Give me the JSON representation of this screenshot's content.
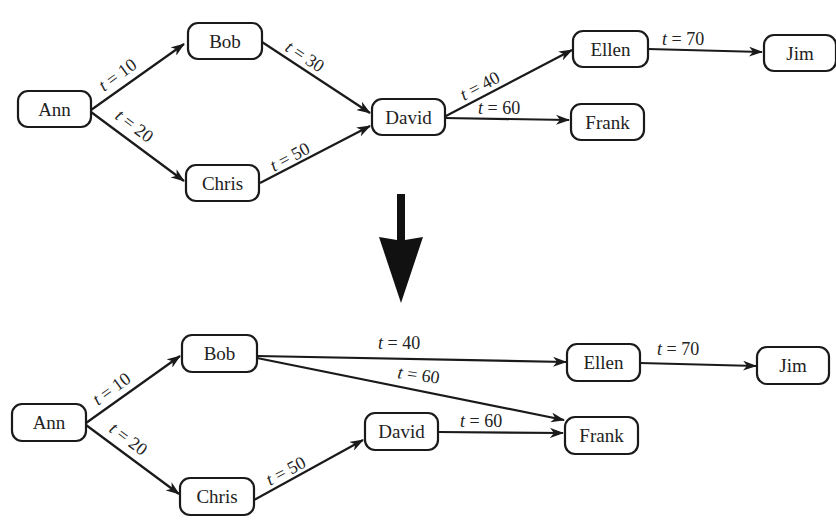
{
  "diagram": {
    "top": {
      "nodes": [
        {
          "id": "ann",
          "label": "Ann"
        },
        {
          "id": "bob",
          "label": "Bob"
        },
        {
          "id": "chris",
          "label": "Chris"
        },
        {
          "id": "david",
          "label": "David"
        },
        {
          "id": "ellen",
          "label": "Ellen"
        },
        {
          "id": "frank",
          "label": "Frank"
        },
        {
          "id": "jim",
          "label": "Jim"
        }
      ],
      "edges": [
        {
          "from": "Ann",
          "to": "Bob",
          "t": "10",
          "label": "t = 10"
        },
        {
          "from": "Ann",
          "to": "Chris",
          "t": "20",
          "label": "t = 20"
        },
        {
          "from": "Bob",
          "to": "David",
          "t": "30",
          "label": "t = 30"
        },
        {
          "from": "Chris",
          "to": "David",
          "t": "50",
          "label": "t = 50"
        },
        {
          "from": "David",
          "to": "Ellen",
          "t": "40",
          "label": "t = 40"
        },
        {
          "from": "David",
          "to": "Frank",
          "t": "60",
          "label": "t = 60"
        },
        {
          "from": "Ellen",
          "to": "Jim",
          "t": "70",
          "label": "t = 70"
        }
      ]
    },
    "transform_arrow": "down-arrow",
    "bottom": {
      "nodes": [
        {
          "id": "ann",
          "label": "Ann"
        },
        {
          "id": "bob",
          "label": "Bob"
        },
        {
          "id": "chris",
          "label": "Chris"
        },
        {
          "id": "david",
          "label": "David"
        },
        {
          "id": "ellen",
          "label": "Ellen"
        },
        {
          "id": "frank",
          "label": "Frank"
        },
        {
          "id": "jim",
          "label": "Jim"
        }
      ],
      "edges": [
        {
          "from": "Ann",
          "to": "Bob",
          "t": "10",
          "label": "t = 10"
        },
        {
          "from": "Ann",
          "to": "Chris",
          "t": "20",
          "label": "t = 20"
        },
        {
          "from": "Chris",
          "to": "David",
          "t": "50",
          "label": "t = 50"
        },
        {
          "from": "Bob",
          "to": "Ellen",
          "t": "40",
          "label": "t = 40"
        },
        {
          "from": "Bob",
          "to": "Frank",
          "t": "60",
          "label": "t = 60"
        },
        {
          "from": "David",
          "to": "Frank",
          "t": "60",
          "label": "t = 60"
        },
        {
          "from": "Ellen",
          "to": "Jim",
          "t": "70",
          "label": "t = 70"
        }
      ]
    }
  }
}
